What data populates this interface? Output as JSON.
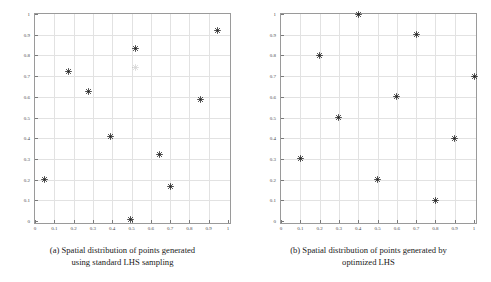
{
  "figure": {
    "background": "#ffffff",
    "axis_color": "#9a9a9a",
    "grid_color": "#e2e2e2",
    "marker_color": "#1a1a1a"
  },
  "panels": [
    {
      "id": "a",
      "caption_line1": "(a) Spatial distribution of points generated",
      "caption_line2": "using standard LHS sampling"
    },
    {
      "id": "b",
      "caption_line1": "(b) Spatial distribution of points generated by",
      "caption_line2": "optimized LHS"
    }
  ],
  "chart_data": [
    {
      "type": "scatter",
      "title": "",
      "subtitle": "",
      "xlabel": "",
      "ylabel": "",
      "xlim": [
        0,
        1
      ],
      "ylim": [
        0,
        1
      ],
      "grid": true,
      "legend": null,
      "marker": "asterisk",
      "xticks": [
        0,
        0.1,
        0.2,
        0.3,
        0.4,
        0.5,
        0.6,
        0.7,
        0.8,
        0.9,
        1
      ],
      "yticks": [
        0,
        0.1,
        0.2,
        0.3,
        0.4,
        0.5,
        0.6,
        0.7,
        0.8,
        0.9,
        1
      ],
      "xticklabels": [
        "0",
        "0.1",
        "0.2",
        "0.3",
        "0.4",
        "0.5",
        "0.6",
        "0.7",
        "0.8",
        "0.9",
        "1"
      ],
      "yticklabels": [
        "0",
        "0.1",
        "0.2",
        "0.3",
        "0.4",
        "0.5",
        "0.6",
        "0.7",
        "0.8",
        "0.9",
        "1"
      ],
      "x": [
        0.05,
        0.175,
        0.275,
        0.39,
        0.495,
        0.52,
        0.645,
        0.7,
        0.86,
        0.945
      ],
      "y": [
        0.2,
        0.72,
        0.625,
        0.41,
        0.005,
        0.835,
        0.32,
        0.165,
        0.585,
        0.92
      ],
      "faint_points": [
        {
          "x": 0.52,
          "y": 0.74
        }
      ]
    },
    {
      "type": "scatter",
      "title": "",
      "subtitle": "",
      "xlabel": "",
      "ylabel": "",
      "xlim": [
        0,
        1
      ],
      "ylim": [
        0,
        1
      ],
      "grid": true,
      "legend": null,
      "marker": "asterisk",
      "xticks": [
        0,
        0.1,
        0.2,
        0.3,
        0.4,
        0.5,
        0.6,
        0.7,
        0.8,
        0.9,
        1
      ],
      "yticks": [
        0,
        0.1,
        0.2,
        0.3,
        0.4,
        0.5,
        0.6,
        0.7,
        0.8,
        0.9,
        1
      ],
      "xticklabels": [
        "0",
        "0.1",
        "0.2",
        "0.3",
        "0.4",
        "0.5",
        "0.6",
        "0.7",
        "0.8",
        "0.9",
        "1"
      ],
      "yticklabels": [
        "0",
        "0.1",
        "0.2",
        "0.3",
        "0.4",
        "0.5",
        "0.6",
        "0.7",
        "0.8",
        "0.9",
        "1"
      ],
      "x": [
        0.1,
        0.2,
        0.3,
        0.4,
        0.5,
        0.6,
        0.7,
        0.8,
        0.9,
        1.0
      ],
      "y": [
        0.3,
        0.8,
        0.5,
        1.0,
        0.2,
        0.6,
        0.9,
        0.1,
        0.4,
        0.7
      ],
      "faint_points": []
    }
  ]
}
